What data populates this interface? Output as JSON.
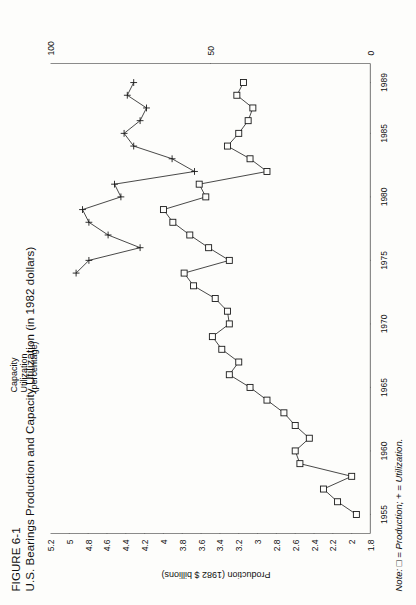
{
  "figure": {
    "number": "FIGURE 6-1",
    "title": "U.S. Bearings Production and Capacity Utilization (in 1982 dollars)",
    "note_prefix": "Note:",
    "note_marker_production": "□",
    "note_mid": " = Production; + = ",
    "note_tail": "Utilization.",
    "note_full": "Note: □ = Production; + = Utilization."
  },
  "chart_data": {
    "type": "line",
    "title": "U.S. Bearings Production and Capacity Utilization (in 1982 dollars)",
    "xlabel": "",
    "ylabel": "Production (1982 $ billions)",
    "y2label": "Capacity Utilization (percentage)",
    "xlim": [
      1953.5,
      1990.5
    ],
    "ylim": [
      1.8,
      5.2
    ],
    "y2lim": [
      0,
      100
    ],
    "grid": false,
    "legend": "note-below",
    "x_ticks": [
      1955,
      1960,
      1965,
      1970,
      1975,
      1980,
      1985,
      1989
    ],
    "x_tick_labels": [
      "1955",
      "1960",
      "1965",
      "1970",
      "1975",
      "1980",
      "1985",
      "1989"
    ],
    "y_ticks": [
      1.8,
      2,
      2.2,
      2.4,
      2.6,
      2.8,
      3,
      3.2,
      3.4,
      3.6,
      3.8,
      4,
      4.2,
      4.4,
      4.6,
      4.8,
      5,
      5.2
    ],
    "y_tick_labels": [
      "1.8",
      "2",
      "2.2",
      "2.4",
      "2.6",
      "2.8",
      "3",
      "3.2",
      "3.4",
      "3.6",
      "3.8",
      "4",
      "4.2",
      "4.4",
      "4.6",
      "4.8",
      "5",
      "5.2"
    ],
    "y2_ticks": [
      0,
      50,
      100
    ],
    "y2_tick_labels": [
      "0",
      "50",
      "100"
    ],
    "series": [
      {
        "name": "Production",
        "marker": "square",
        "axis": "left",
        "x": [
          1955,
          1956,
          1957,
          1958,
          1959,
          1960,
          1961,
          1962,
          1963,
          1964,
          1965,
          1966,
          1967,
          1968,
          1969,
          1970,
          1971,
          1972,
          1973,
          1974,
          1975,
          1976,
          1977,
          1978,
          1979,
          1980,
          1981,
          1982,
          1983,
          1984,
          1985,
          1986,
          1987,
          1988,
          1989
        ],
        "values": [
          1.95,
          2.15,
          2.3,
          2.0,
          2.55,
          2.6,
          2.45,
          2.6,
          2.72,
          2.9,
          3.08,
          3.3,
          3.2,
          3.38,
          3.48,
          3.3,
          3.32,
          3.45,
          3.68,
          3.78,
          3.3,
          3.52,
          3.72,
          3.9,
          4.0,
          3.55,
          3.62,
          2.9,
          3.08,
          3.32,
          3.2,
          3.1,
          3.05,
          3.22,
          3.15
        ]
      },
      {
        "name": "Utilization",
        "marker": "plus",
        "axis": "right",
        "x": [
          1974,
          1975,
          1976,
          1977,
          1978,
          1979,
          1980,
          1981,
          1982,
          1983,
          1984,
          1985,
          1986,
          1987,
          1988,
          1989
        ],
        "values": [
          92,
          88,
          72,
          82,
          88,
          90,
          78,
          80,
          55,
          62,
          74,
          77,
          72,
          70,
          76,
          74
        ]
      }
    ]
  }
}
